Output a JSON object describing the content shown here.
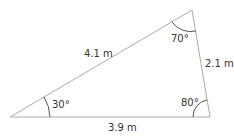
{
  "diagram": {
    "type": "triangle",
    "vertices": {
      "left": {
        "x": 10,
        "y": 117
      },
      "top": {
        "x": 192,
        "y": 10
      },
      "right": {
        "x": 210,
        "y": 117
      }
    },
    "sides": {
      "hypotenuse": "4.1 m",
      "right_side": "2.1 m",
      "base": "3.9 m"
    },
    "angles": {
      "left": "30°",
      "top": "70°",
      "right": "80°"
    },
    "colors": {
      "line": "#aaaaaa",
      "arc": "#555555",
      "text": "#333333"
    }
  }
}
